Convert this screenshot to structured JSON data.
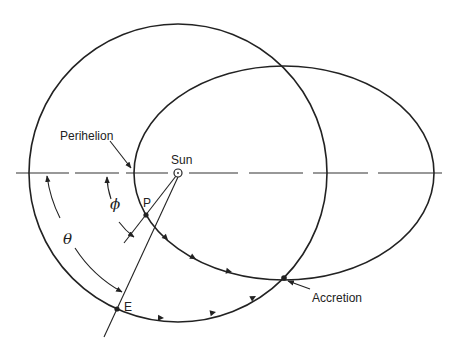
{
  "diagram": {
    "type": "orbital geometry",
    "labels": {
      "perihelion": "Perihelion",
      "sun": "Sun",
      "p_point": "P",
      "e_point": "E",
      "accretion": "Accretion",
      "theta": "θ",
      "phi": "ϕ"
    },
    "elements": {
      "sun": {
        "x": 178,
        "y": 173,
        "r": 4
      },
      "circular_orbit": {
        "cx": 178,
        "cy": 173,
        "r": 149
      },
      "elliptical_orbit": {
        "cx": 284,
        "cy": 173,
        "rx": 150,
        "ry": 107
      },
      "apsidal_line": {
        "y": 173,
        "x_start": 16,
        "x_end": 442,
        "style": "dashed"
      },
      "point_P": {
        "x": 146,
        "y": 215
      },
      "point_E": {
        "x": 117,
        "y": 309
      },
      "point_accretion": {
        "x": 284,
        "y": 278
      }
    },
    "colors": {
      "stroke": "#222222",
      "background": "#ffffff"
    }
  }
}
